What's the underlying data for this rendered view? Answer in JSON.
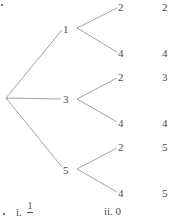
{
  "tree": {
    "root": {
      "x": 5,
      "y": 98
    },
    "level1": [
      {
        "label": "1",
        "x": 67,
        "y": 29,
        "children": [
          {
            "label": "2",
            "x": 122,
            "y": 7
          },
          {
            "label": "4",
            "x": 122,
            "y": 53
          }
        ]
      },
      {
        "label": "3",
        "x": 67,
        "y": 99,
        "children": [
          {
            "label": "2",
            "x": 122,
            "y": 77
          },
          {
            "label": "4",
            "x": 122,
            "y": 123
          }
        ]
      },
      {
        "label": "5",
        "x": 67,
        "y": 170,
        "children": [
          {
            "label": "2",
            "x": 122,
            "y": 147
          },
          {
            "label": "4",
            "x": 122,
            "y": 193
          }
        ]
      }
    ],
    "line_color": "#8a8a8a"
  },
  "results_column": [
    "2",
    "4",
    "3",
    "4",
    "5",
    "5"
  ],
  "answers": {
    "part_i_prefix": "i.",
    "part_i_numerator": "1",
    "part_ii": "ii. 0"
  }
}
